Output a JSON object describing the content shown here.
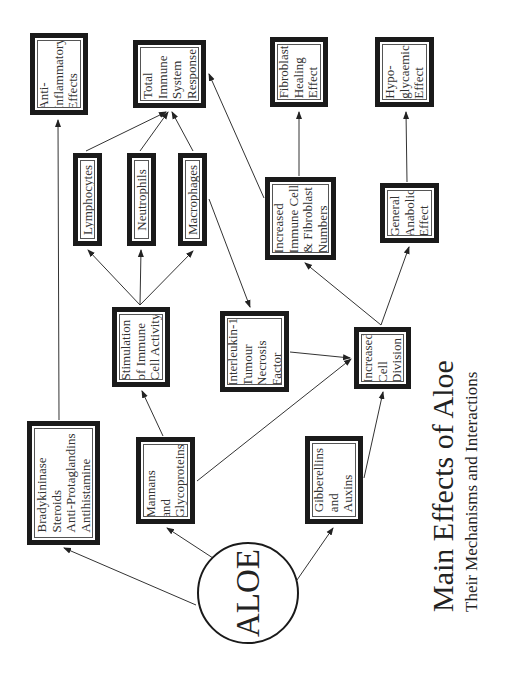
{
  "title": "Main Effects of Aloe",
  "subtitle": "Their Mechanisms and Interactions",
  "center_node": {
    "label": "ALOE"
  },
  "nodes": {
    "anti_inflammatory": {
      "lines": [
        "Anti-",
        "Inflammatory",
        "Effects"
      ]
    },
    "total_immune": {
      "lines": [
        "Total",
        "Immune",
        "System",
        "Response"
      ]
    },
    "lymphocytes": {
      "lines": [
        "Lymphocytes"
      ]
    },
    "neutrophils": {
      "lines": [
        "Neutrophils"
      ]
    },
    "macrophages": {
      "lines": [
        "Macrophages"
      ]
    },
    "fibroblast_healing": {
      "lines": [
        "Fibroblast",
        "Healing",
        "Effect"
      ]
    },
    "hypoglycaemic": {
      "lines": [
        "Hypo-",
        "glycaemic",
        "Effect"
      ]
    },
    "increased_immune_cell": {
      "lines": [
        "Increased",
        "Immune Cell",
        "& Fibroblast",
        "Numbers"
      ]
    },
    "general_anabolic": {
      "lines": [
        "General",
        "Anabolic",
        "Effect"
      ]
    },
    "stimulation": {
      "lines": [
        "Stimulation",
        "of Immune",
        "Cell Activity"
      ]
    },
    "interleukin": {
      "lines": [
        "Interleukin-1",
        "Tumour",
        "Necrosis",
        "Factor"
      ]
    },
    "bradykininase": {
      "lines": [
        "Bradykininase",
        "Steroids",
        "Anti-Protaglandins",
        "Antihistamine"
      ]
    },
    "mannans": {
      "lines": [
        "Mannans",
        "and",
        "Glycoproteins"
      ]
    },
    "increased_cell_division": {
      "lines": [
        "Increased",
        "Cell",
        "Division"
      ]
    },
    "gibberellins": {
      "lines": [
        "Gibberellins",
        "and",
        "Auxins"
      ]
    }
  },
  "edges": [
    {
      "from": "aloe",
      "to": "bradykininase"
    },
    {
      "from": "aloe",
      "to": "mannans"
    },
    {
      "from": "aloe",
      "to": "gibberellins"
    },
    {
      "from": "bradykininase",
      "to": "anti_inflammatory"
    },
    {
      "from": "mannans",
      "to": "stimulation"
    },
    {
      "from": "mannans",
      "to": "increased_cell_division"
    },
    {
      "from": "gibberellins",
      "to": "increased_cell_division"
    },
    {
      "from": "stimulation",
      "to": "lymphocytes"
    },
    {
      "from": "stimulation",
      "to": "neutrophils"
    },
    {
      "from": "stimulation",
      "to": "macrophages"
    },
    {
      "from": "lymphocytes",
      "to": "total_immune"
    },
    {
      "from": "neutrophils",
      "to": "total_immune"
    },
    {
      "from": "macrophages",
      "to": "total_immune"
    },
    {
      "from": "macrophages",
      "to": "interleukin"
    },
    {
      "from": "interleukin",
      "to": "increased_cell_division"
    },
    {
      "from": "increased_cell_division",
      "to": "increased_immune_cell"
    },
    {
      "from": "increased_cell_division",
      "to": "general_anabolic"
    },
    {
      "from": "increased_immune_cell",
      "to": "total_immune"
    },
    {
      "from": "increased_immune_cell",
      "to": "fibroblast_healing"
    },
    {
      "from": "general_anabolic",
      "to": "hypoglycaemic"
    }
  ]
}
